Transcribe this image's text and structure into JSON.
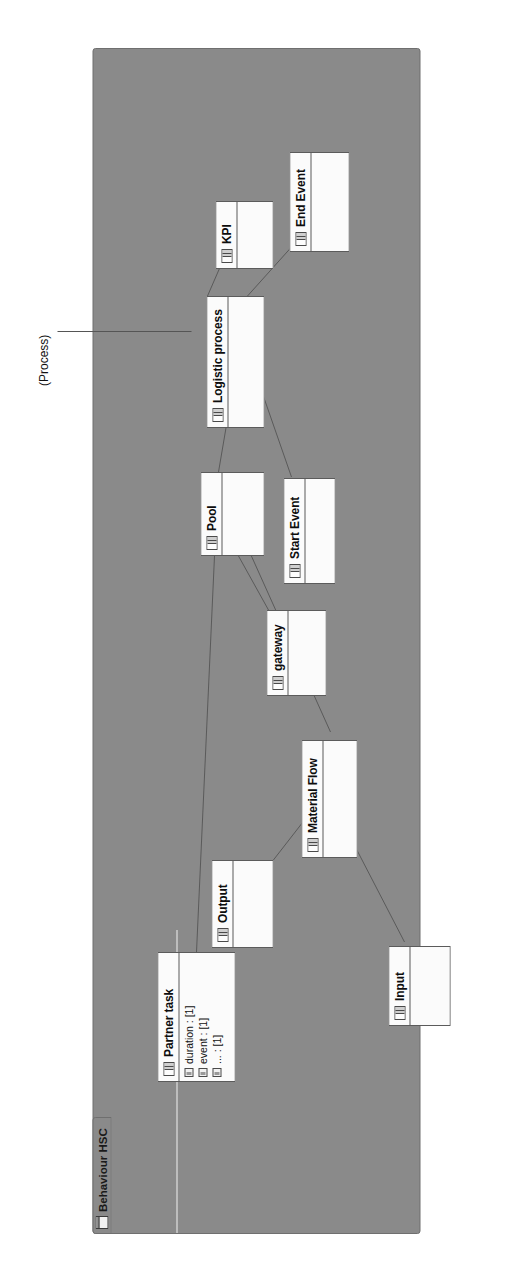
{
  "window": {
    "background_color": "#ffffff"
  },
  "diagram": {
    "frame_label": "Behaviour HSC",
    "frame_icon": "diagram-icon",
    "canvas_color": "#8a8a8a",
    "node_fill": "#fbfbfb",
    "node_border": "#5b5b5b",
    "link_color": "#5a5a5a",
    "annotation": {
      "text": "(Process)",
      "target": "Logistic process"
    },
    "nodes": [
      {
        "id": "partner-task",
        "title": "Partner task",
        "icon": "uml-class-icon",
        "attributes": [
          {
            "icon": "attribute-icon",
            "text": "duration : [1]"
          },
          {
            "icon": "attribute-icon",
            "text": "event : [1]"
          },
          {
            "icon": "attribute-icon",
            "text": "... : [1]"
          }
        ]
      },
      {
        "id": "pool",
        "title": "Pool",
        "icon": "uml-class-icon",
        "attributes": []
      },
      {
        "id": "logistic-process",
        "title": "Logistic process",
        "icon": "uml-class-icon",
        "attributes": []
      },
      {
        "id": "kpi",
        "title": "KPI",
        "icon": "uml-class-icon",
        "attributes": []
      },
      {
        "id": "end-event",
        "title": "End Event",
        "icon": "uml-class-icon",
        "attributes": []
      },
      {
        "id": "start-event",
        "title": "Start Event",
        "icon": "uml-class-icon",
        "attributes": []
      },
      {
        "id": "gateway",
        "title": "gateway",
        "icon": "uml-class-icon",
        "attributes": []
      },
      {
        "id": "material-flow",
        "title": "Material Flow",
        "icon": "uml-class-icon",
        "attributes": []
      },
      {
        "id": "output",
        "title": "Output",
        "icon": "uml-class-icon",
        "attributes": []
      },
      {
        "id": "input",
        "title": "Input",
        "icon": "uml-class-icon",
        "attributes": []
      }
    ],
    "links": [
      {
        "from": "logistic-process",
        "to": "kpi"
      },
      {
        "from": "logistic-process",
        "to": "end-event"
      },
      {
        "from": "logistic-process",
        "to": "start-event"
      },
      {
        "from": "logistic-process",
        "to": "pool"
      },
      {
        "from": "pool",
        "to": "partner-task"
      },
      {
        "from": "pool",
        "to": "gateway"
      },
      {
        "from": "pool",
        "to": "material-flow"
      },
      {
        "from": "material-flow",
        "to": "output"
      },
      {
        "from": "material-flow",
        "to": "input"
      }
    ]
  }
}
